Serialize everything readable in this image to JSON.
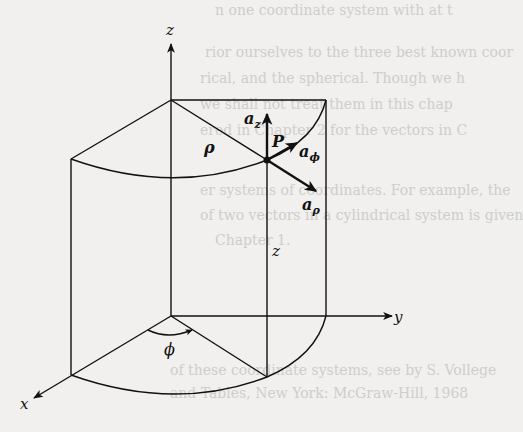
{
  "figure": {
    "type": "cylindrical-coordinate-diagram",
    "axes": {
      "z": "z",
      "y": "y",
      "x": "x"
    },
    "labels": {
      "rho": "ρ",
      "phi": "ϕ",
      "z_height": "z",
      "point": "P"
    },
    "unit_vectors": {
      "a_z": {
        "base": "a",
        "sub": "z"
      },
      "a_phi": {
        "base": "a",
        "sub": "ϕ"
      },
      "a_rho": {
        "base": "a",
        "sub": "ρ"
      }
    },
    "colors": {
      "ink": "#111111",
      "paper": "#f1f0ee",
      "bleed": "#cfcdca"
    }
  },
  "bleed_through": [
    "n one coordinate system with at t",
    "rior ourselves to the three best known coor",
    "rical, and the spherical. Though we h",
    "we shall not treat them in this chap",
    "ered in Chapter 2 for the vectors in C",
    "er systems of coordinates. For example, the",
    "of two vectors in a cylindrical system is given",
    "Chapter 1.",
    "of these coordinate systems, see by S. Vollege",
    "and Tables, New York: McGraw-Hill, 1968"
  ]
}
